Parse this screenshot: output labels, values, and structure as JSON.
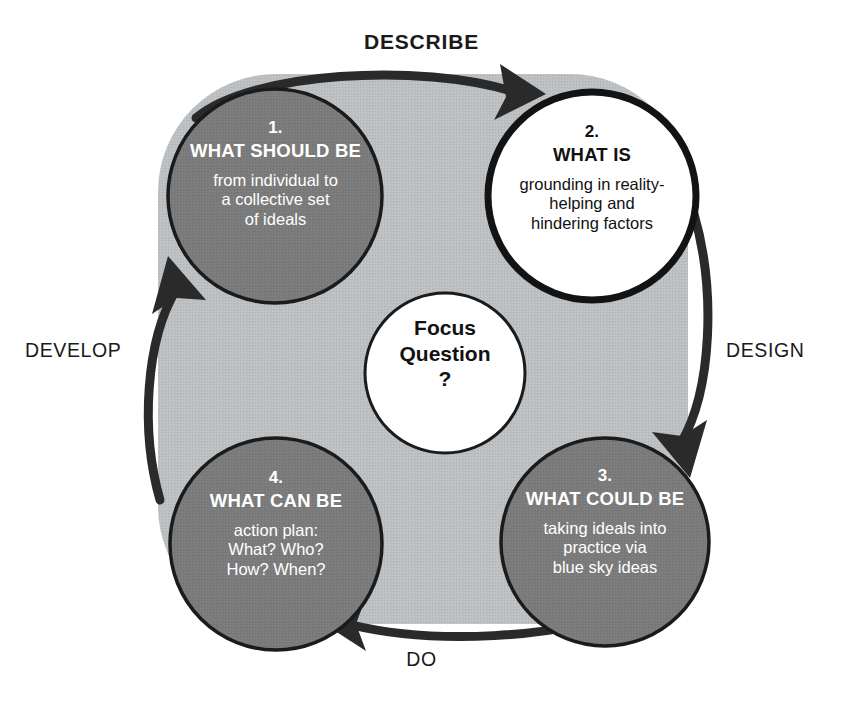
{
  "diagram": {
    "center": {
      "line1": "Focus",
      "line2": "Question",
      "line3": "?"
    },
    "phases": [
      {
        "id": "describe",
        "label": "DESCRIBE",
        "position": "top",
        "emphasis": "bold"
      },
      {
        "id": "design",
        "label": "DESIGN",
        "position": "right",
        "emphasis": "normal"
      },
      {
        "id": "do",
        "label": "DO",
        "position": "bottom",
        "emphasis": "normal"
      },
      {
        "id": "develop",
        "label": "DEVELOP",
        "position": "left",
        "emphasis": "normal"
      }
    ],
    "stages": [
      {
        "number": "1.",
        "title": "WHAT SHOULD BE",
        "desc_line1": "from individual to",
        "desc_line2": "a collective set",
        "desc_line3": "of ideals",
        "fill": "#7b7b7b",
        "text": "#ffffff",
        "position": "top-left"
      },
      {
        "number": "2.",
        "title": "WHAT IS",
        "desc_line1": "grounding in reality-",
        "desc_line2": "helping and",
        "desc_line3": "hindering factors",
        "fill": "#ffffff",
        "text": "#111111",
        "position": "top-right"
      },
      {
        "number": "3.",
        "title": "WHAT COULD BE",
        "desc_line1": "taking ideals into",
        "desc_line2": "practice via",
        "desc_line3": "blue sky ideas",
        "fill": "#7b7b7b",
        "text": "#ffffff",
        "position": "bottom-right"
      },
      {
        "number": "4.",
        "title": "WHAT CAN BE",
        "desc_line1": "action plan:",
        "desc_line2": "What? Who?",
        "desc_line3": "How? When?",
        "fill": "#7b7b7b",
        "text": "#ffffff",
        "position": "bottom-left"
      }
    ],
    "colors": {
      "background": "#ffffff",
      "band": "#bcc0c3",
      "circle_dark": "#7b7b7b",
      "circle_light": "#ffffff",
      "outline": "#1b1b1b",
      "arrow": "#2a2a2a"
    },
    "flow_direction": "clockwise"
  }
}
